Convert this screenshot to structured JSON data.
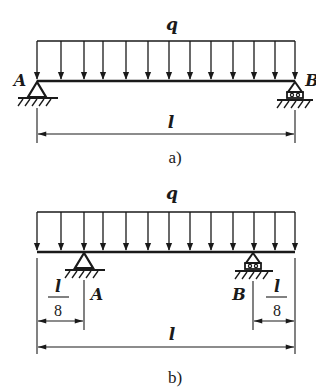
{
  "figure_a": {
    "load_label": "q",
    "left_support_label": "A",
    "right_support_label": "B",
    "span_label": "l",
    "caption": "a)",
    "left_support_type": "pin",
    "right_support_type": "roller"
  },
  "figure_b": {
    "load_label": "q",
    "left_support_label": "A",
    "right_support_label": "B",
    "left_overhang": {
      "numerator": "l",
      "denominator": "8"
    },
    "right_overhang": {
      "numerator": "l",
      "denominator": "8"
    },
    "span_label": "l",
    "caption": "b)",
    "left_support_type": "pin",
    "right_support_type": "roller"
  },
  "colors": {
    "ink": "#1a1a1a",
    "background": "#ffffff"
  }
}
